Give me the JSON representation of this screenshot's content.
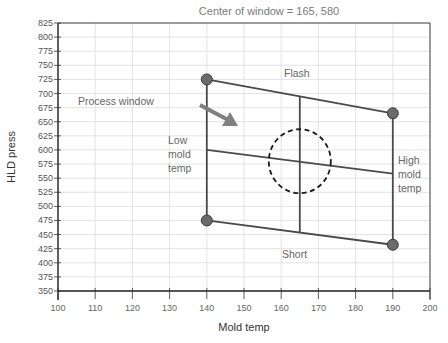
{
  "chart_data": {
    "type": "line",
    "title": "Center of window = 165, 580",
    "xlabel": "Mold temp",
    "ylabel": "HLD press",
    "xlim": [
      100,
      200
    ],
    "ylim": [
      350,
      825
    ],
    "grid": true,
    "x_ticks": [
      "100",
      "110",
      "120",
      "130",
      "140",
      "150",
      "160",
      "170",
      "180",
      "190",
      "200"
    ],
    "y_ticks": [
      "825",
      "800",
      "775",
      "750",
      "725",
      "700",
      "675",
      "650",
      "625",
      "600",
      "575",
      "550",
      "525",
      "500",
      "475",
      "450",
      "425",
      "400",
      "375",
      "350"
    ],
    "series": [
      {
        "name": "Flash edge",
        "points": [
          [
            140,
            725
          ],
          [
            190,
            665
          ]
        ]
      },
      {
        "name": "Short edge",
        "points": [
          [
            140,
            475
          ],
          [
            190,
            432
          ]
        ]
      },
      {
        "name": "Low mold temp edge",
        "points": [
          [
            140,
            725
          ],
          [
            140,
            475
          ]
        ]
      },
      {
        "name": "High mold temp edge",
        "points": [
          [
            190,
            665
          ],
          [
            190,
            432
          ]
        ]
      },
      {
        "name": "Pressure centerline",
        "points": [
          [
            140,
            600
          ],
          [
            190,
            558
          ]
        ]
      },
      {
        "name": "Temp centerline",
        "points": [
          [
            165,
            695
          ],
          [
            165,
            453
          ]
        ]
      }
    ],
    "corner_markers": [
      [
        140,
        725
      ],
      [
        190,
        665
      ],
      [
        140,
        475
      ],
      [
        190,
        432
      ]
    ],
    "center": [
      165,
      580
    ],
    "center_circle": {
      "cx": 165,
      "cy": 580,
      "style": "dashed"
    },
    "annotations": [
      {
        "text": "Flash",
        "x": 162,
        "y": 695
      },
      {
        "text": "Short",
        "x": 164,
        "y": 462
      },
      {
        "text": "Low mold temp",
        "x": 133,
        "y": 600
      },
      {
        "text": "High mold temp",
        "x": 191,
        "y": 568
      },
      {
        "text": "Process window",
        "x": 107,
        "y": 677
      }
    ]
  },
  "labels": {
    "title": "Center of window = 165, 580",
    "xlabel": "Mold temp",
    "ylabel": "HLD press",
    "flash": "Flash",
    "short": "Short",
    "low": [
      "Low",
      "mold",
      "temp"
    ],
    "high": [
      "High",
      "mold",
      "temp"
    ],
    "process_window": "Process window"
  }
}
